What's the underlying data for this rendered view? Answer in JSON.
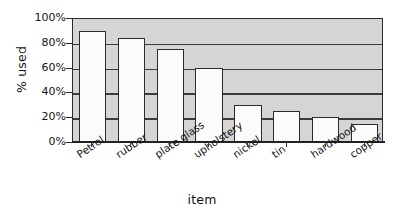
{
  "chart_data": {
    "type": "bar",
    "title": "",
    "xlabel": "item",
    "ylabel": "% used",
    "categories": [
      "Petrol",
      "rubber",
      "plate glass",
      "upholstery",
      "nickel",
      "tin",
      "hardwood",
      "copper"
    ],
    "values": [
      89,
      83,
      74,
      59,
      29,
      24,
      19,
      14
    ],
    "ylim": [
      0,
      100
    ],
    "ytick_labels": [
      "0%",
      "20%",
      "40%",
      "60%",
      "80%",
      "100%"
    ],
    "ytick_values": [
      0,
      20,
      40,
      60,
      80,
      100
    ],
    "grid": true,
    "gridlines_at": [
      20,
      40,
      60,
      80
    ],
    "legend": "none",
    "series": [
      {
        "name": "% used",
        "values": [
          89,
          83,
          74,
          59,
          29,
          24,
          19,
          14
        ]
      }
    ],
    "colors": {
      "bar_fill": "#fbfbfb",
      "bar_border": "#2b2b2b",
      "plot_background": "#d5d5d5",
      "gridline": "#3a3a3a",
      "axis": "#222222",
      "text": "#141414",
      "page_background": "#ffffff"
    }
  }
}
